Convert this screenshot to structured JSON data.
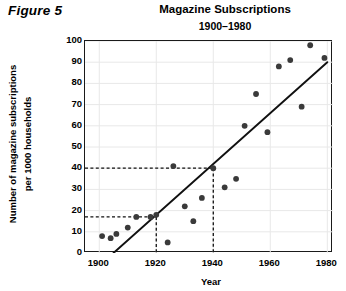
{
  "figure": {
    "label": "Figure 5"
  },
  "chart_data": {
    "type": "scatter",
    "title": "Magazine Subscriptions",
    "subtitle": "1900–1980",
    "xlabel": "Year",
    "ylabel_line1": "Number of magazine subscriptions",
    "ylabel_line2": "per 1000 households",
    "xlim": [
      1895,
      1982
    ],
    "ylim": [
      0,
      100
    ],
    "xticks": [
      1900,
      1920,
      1940,
      1960,
      1980
    ],
    "yticks": [
      0,
      10,
      20,
      30,
      40,
      50,
      60,
      70,
      80,
      90,
      100
    ],
    "grid": true,
    "legend": "none",
    "point_color": "#3a3a3a",
    "line_color": "#111111",
    "grid_color": "#e8e8e8",
    "axis_color": "#1a1a1a",
    "points": [
      {
        "x": 1901,
        "y": 8
      },
      {
        "x": 1904,
        "y": 7
      },
      {
        "x": 1906,
        "y": 9
      },
      {
        "x": 1910,
        "y": 12
      },
      {
        "x": 1913,
        "y": 17
      },
      {
        "x": 1918,
        "y": 17
      },
      {
        "x": 1920,
        "y": 18
      },
      {
        "x": 1924,
        "y": 5
      },
      {
        "x": 1926,
        "y": 41
      },
      {
        "x": 1930,
        "y": 22
      },
      {
        "x": 1933,
        "y": 15
      },
      {
        "x": 1936,
        "y": 26
      },
      {
        "x": 1940,
        "y": 40
      },
      {
        "x": 1944,
        "y": 31
      },
      {
        "x": 1948,
        "y": 35
      },
      {
        "x": 1951,
        "y": 60
      },
      {
        "x": 1955,
        "y": 75
      },
      {
        "x": 1959,
        "y": 57
      },
      {
        "x": 1963,
        "y": 88
      },
      {
        "x": 1967,
        "y": 91
      },
      {
        "x": 1971,
        "y": 69
      },
      {
        "x": 1974,
        "y": 98
      },
      {
        "x": 1979,
        "y": 92
      }
    ],
    "trend_line": {
      "x1": 1905,
      "y1": 0,
      "x2": 1980,
      "y2": 90
    },
    "reference_lines": [
      {
        "name": "reference-40",
        "y": 40,
        "x_from": 1895,
        "x_to": 1940,
        "drop_to_axis": true
      },
      {
        "name": "reference-17",
        "y": 17,
        "x_from": 1895,
        "x_to": 1920,
        "drop_to_axis": true
      }
    ]
  }
}
